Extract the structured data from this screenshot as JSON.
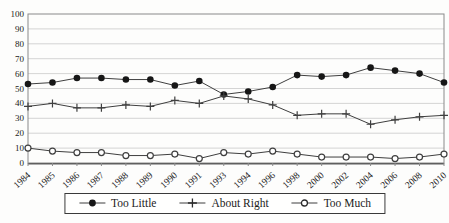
{
  "chart_data": {
    "type": "line",
    "title": "",
    "xlabel": "",
    "ylabel": "",
    "categories": [
      "1984",
      "1985",
      "1986",
      "1987",
      "1988",
      "1989",
      "1990",
      "1991",
      "1993",
      "1994",
      "1996",
      "1998",
      "2000",
      "2002",
      "2004",
      "2006",
      "2008",
      "2010"
    ],
    "series": [
      {
        "name": "Too Little",
        "marker": "filled-circle",
        "values": [
          53,
          54,
          57,
          57,
          56,
          56,
          52,
          55,
          46,
          48,
          51,
          59,
          58,
          59,
          64,
          62,
          60,
          54
        ]
      },
      {
        "name": "About Right",
        "marker": "plus",
        "values": [
          38,
          40,
          37,
          37,
          39,
          38,
          42,
          40,
          45,
          43,
          39,
          32,
          33,
          33,
          26,
          29,
          31,
          32
        ]
      },
      {
        "name": "Too Much",
        "marker": "open-circle",
        "values": [
          10,
          8,
          7,
          7,
          5,
          5,
          6,
          3,
          7,
          6,
          8,
          6,
          4,
          4,
          4,
          3,
          4,
          6
        ]
      }
    ],
    "ylim": [
      0,
      100
    ],
    "yticks": [
      0,
      10,
      20,
      30,
      40,
      50,
      60,
      70,
      80,
      90,
      100
    ],
    "grid": "horizontal",
    "legend_position": "bottom-center",
    "colors": {
      "line": "#3f3f3f",
      "marker_fill": "#161616",
      "grid": "#c9c9c9",
      "axis": "#8a8a8a",
      "axis_bottom": "#5f5f5f",
      "text": "#222222",
      "background": "#fdfdfc"
    }
  }
}
